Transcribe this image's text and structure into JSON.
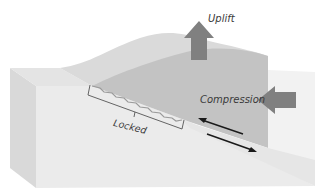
{
  "diagram": {
    "type": "block-diagram",
    "labels": {
      "uplift": "Uplift",
      "compression": "Compression",
      "locked": "Locked"
    },
    "arrows": [
      {
        "name": "uplift-arrow",
        "direction": "up",
        "color": "#7f7f7f"
      },
      {
        "name": "compression-arrow",
        "direction": "left",
        "color": "#7f7f7f"
      },
      {
        "name": "upper-plate-slip-arrow",
        "direction": "up-left",
        "color": "#1a1a1a"
      },
      {
        "name": "lower-plate-slip-arrow",
        "direction": "down-right",
        "color": "#1a1a1a"
      }
    ],
    "colors": {
      "block_light": "#e9e9e9",
      "block_side": "#dcdcdc",
      "upper_plate": "#c4c4c4",
      "upper_plate_top": "#d6d6d6",
      "arrow_gray": "#808080",
      "bracket": "#555555"
    }
  }
}
